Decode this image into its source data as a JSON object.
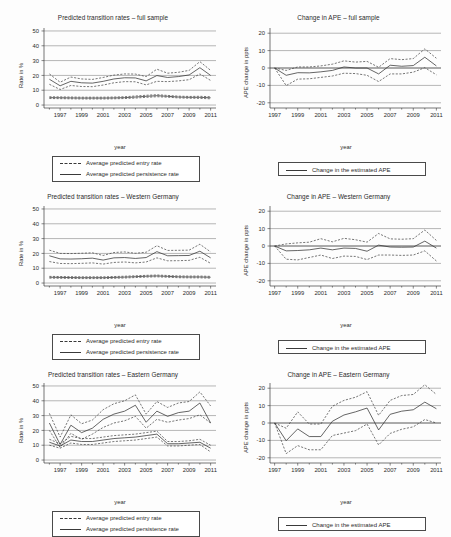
{
  "figure": {
    "caption_absent": true,
    "panel_count": 6,
    "xlabel": "year",
    "ylabel_rate": "Rate in %",
    "ylabel_ape": "APE change in ppts"
  },
  "legends": {
    "rates": {
      "entry": "Average predicted entry rate",
      "persistence": "Average predicted persistence rate"
    },
    "ape": {
      "estimate": "Change in the estimated APE"
    }
  },
  "chart_data": [
    {
      "id": "rates-full-sample",
      "type": "line",
      "title": "Predicted transition rates – full sample",
      "xlabel": "year",
      "ylabel": "Rate in %",
      "xlim": [
        1995.5,
        2011.5
      ],
      "ylim": [
        -2,
        52
      ],
      "yticks": [
        0,
        10,
        20,
        30,
        40,
        50
      ],
      "xticks": [
        1997,
        1999,
        2001,
        2003,
        2005,
        2007,
        2009,
        2011
      ],
      "xticks_minor_step": 1,
      "grid": "horizontal",
      "legend_position": "below",
      "x": [
        1996,
        1997,
        1998,
        1999,
        2000,
        2001,
        2002,
        2003,
        2004,
        2005,
        2006,
        2007,
        2008,
        2009,
        2010,
        2011
      ],
      "series": [
        {
          "name": "Average predicted persistence rate",
          "style": "solid",
          "values": [
            17.4,
            13.0,
            16.0,
            15.0,
            14.8,
            16.0,
            17.6,
            18.4,
            18.3,
            16.3,
            19.9,
            18.6,
            19.2,
            20.3,
            25.2,
            20.0
          ]
        },
        {
          "name": "Persistence rate upper CI",
          "style": "dashed",
          "values": [
            21.0,
            15.4,
            18.9,
            17.6,
            17.3,
            18.6,
            20.2,
            21.0,
            20.9,
            19.2,
            24.2,
            21.5,
            22.1,
            23.4,
            29.3,
            23.4
          ]
        },
        {
          "name": "Persistence rate lower CI",
          "style": "dashed",
          "values": [
            14.0,
            10.5,
            13.2,
            12.5,
            12.4,
            13.5,
            15.0,
            15.8,
            15.7,
            13.6,
            16.0,
            15.8,
            16.3,
            17.1,
            21.0,
            16.6
          ]
        },
        {
          "name": "Average predicted entry rate",
          "style": "solid",
          "values": [
            5.0,
            4.9,
            4.8,
            4.7,
            4.7,
            4.7,
            4.8,
            5.0,
            5.4,
            5.9,
            6.3,
            5.9,
            5.4,
            5.2,
            5.2,
            4.9
          ]
        },
        {
          "name": "Entry rate upper CI",
          "style": "dashed",
          "values": [
            5.6,
            5.5,
            5.4,
            5.3,
            5.3,
            5.3,
            5.4,
            5.6,
            6.1,
            6.6,
            7.0,
            6.5,
            6.0,
            5.8,
            5.9,
            5.6
          ]
        },
        {
          "name": "Entry rate lower CI",
          "style": "dashed",
          "values": [
            4.4,
            4.3,
            4.2,
            4.1,
            4.1,
            4.1,
            4.2,
            4.4,
            4.7,
            5.2,
            5.6,
            5.3,
            4.8,
            4.6,
            4.5,
            4.2
          ]
        }
      ]
    },
    {
      "id": "ape-full-sample",
      "type": "line",
      "title": "Change in APE – full sample",
      "xlabel": "year",
      "ylabel": "APE change in ppts",
      "xlim": [
        1996.6,
        2011.4
      ],
      "ylim": [
        -23,
        23
      ],
      "yticks": [
        -20,
        -10,
        0,
        10,
        20
      ],
      "xticks": [
        1997,
        1999,
        2001,
        2003,
        2005,
        2007,
        2009,
        2011
      ],
      "xticks_minor_step": 1,
      "grid": "horizontal",
      "legend_position": "below",
      "x": [
        1997,
        1998,
        1999,
        2000,
        2001,
        2002,
        2003,
        2004,
        2005,
        2006,
        2007,
        2008,
        2009,
        2010,
        2011
      ],
      "series": [
        {
          "name": "Change in the estimated APE",
          "style": "solid",
          "values": [
            0.0,
            -4.2,
            -2.7,
            -2.8,
            -2.2,
            -1.4,
            0.6,
            0.0,
            0.0,
            -3.4,
            1.6,
            1.0,
            1.4,
            6.2,
            1.2
          ]
        },
        {
          "name": "APE upper CI",
          "style": "dashed",
          "values": [
            0.0,
            -1.4,
            0.6,
            0.6,
            1.2,
            2.2,
            4.1,
            3.4,
            3.8,
            0.4,
            5.4,
            4.8,
            5.4,
            11.0,
            5.6
          ]
        },
        {
          "name": "APE lower CI",
          "style": "dashed",
          "values": [
            0.0,
            -10.1,
            -6.4,
            -6.2,
            -5.4,
            -4.6,
            -3.0,
            -3.2,
            -4.2,
            -7.8,
            -3.4,
            -3.4,
            -2.4,
            0.2,
            -3.9
          ]
        }
      ]
    },
    {
      "id": "rates-western-germany",
      "type": "line",
      "title": "Predicted transition rates – Western Germany",
      "xlabel": "year",
      "ylabel": "Rate in %",
      "xlim": [
        1995.5,
        2011.5
      ],
      "ylim": [
        -2,
        52
      ],
      "yticks": [
        0,
        10,
        20,
        30,
        40,
        50
      ],
      "xticks": [
        1997,
        1999,
        2001,
        2003,
        2005,
        2007,
        2009,
        2011
      ],
      "xticks_minor_step": 1,
      "grid": "horizontal",
      "legend_position": "below",
      "x": [
        1996,
        1997,
        1998,
        1999,
        2000,
        2001,
        2002,
        2003,
        2004,
        2005,
        2006,
        2007,
        2008,
        2009,
        2010,
        2011
      ],
      "series": [
        {
          "name": "Average predicted persistence rate",
          "style": "solid",
          "values": [
            18.4,
            16.3,
            16.2,
            16.4,
            16.8,
            15.5,
            17.0,
            17.2,
            16.6,
            17.2,
            21.2,
            18.4,
            18.5,
            18.6,
            21.5,
            17.0
          ]
        },
        {
          "name": "Persistence rate upper CI",
          "style": "dashed",
          "values": [
            22.2,
            20.0,
            19.9,
            20.1,
            20.4,
            18.6,
            20.6,
            21.0,
            20.1,
            20.8,
            25.2,
            22.0,
            22.1,
            22.2,
            26.2,
            21.0
          ]
        },
        {
          "name": "Persistence rate lower CI",
          "style": "dashed",
          "values": [
            14.5,
            13.2,
            13.1,
            13.3,
            13.6,
            12.8,
            13.9,
            14.2,
            13.6,
            14.2,
            17.0,
            15.0,
            15.1,
            15.3,
            17.4,
            13.3
          ]
        },
        {
          "name": "Average predicted entry rate",
          "style": "solid",
          "values": [
            3.9,
            3.8,
            3.7,
            3.6,
            3.6,
            3.6,
            3.8,
            4.0,
            4.3,
            4.6,
            4.8,
            4.5,
            4.2,
            4.1,
            4.1,
            3.9
          ]
        },
        {
          "name": "Entry rate upper CI",
          "style": "dashed",
          "values": [
            4.5,
            4.4,
            4.3,
            4.2,
            4.2,
            4.2,
            4.4,
            4.6,
            4.9,
            5.2,
            5.4,
            5.1,
            4.8,
            4.7,
            4.7,
            4.5
          ]
        },
        {
          "name": "Entry rate lower CI",
          "style": "dashed",
          "values": [
            3.3,
            3.2,
            3.1,
            3.0,
            3.0,
            3.0,
            3.2,
            3.4,
            3.7,
            4.0,
            4.2,
            3.9,
            3.6,
            3.5,
            3.5,
            3.3
          ]
        }
      ]
    },
    {
      "id": "ape-western-germany",
      "type": "line",
      "title": "Change in APE – Western Germany",
      "xlabel": "year",
      "ylabel": "APE change in ppts",
      "xlim": [
        1996.6,
        2011.4
      ],
      "ylim": [
        -23,
        23
      ],
      "yticks": [
        -20,
        -10,
        0,
        10,
        20
      ],
      "xticks": [
        1997,
        1999,
        2001,
        2003,
        2005,
        2007,
        2009,
        2011
      ],
      "xticks_minor_step": 1,
      "grid": "horizontal",
      "legend_position": "below",
      "x": [
        1997,
        1998,
        1999,
        2000,
        2001,
        2002,
        2003,
        2004,
        2005,
        2006,
        2007,
        2008,
        2009,
        2010,
        2011
      ],
      "series": [
        {
          "name": "Change in the estimated APE",
          "style": "solid",
          "values": [
            0.0,
            -2.8,
            -2.6,
            -2.2,
            -1.2,
            -2.2,
            -1.2,
            -1.4,
            -3.0,
            0.5,
            -0.6,
            -0.7,
            -0.6,
            2.8,
            -1.2
          ]
        },
        {
          "name": "APE upper CI",
          "style": "dashed",
          "values": [
            0.0,
            1.2,
            1.8,
            2.2,
            4.2,
            2.4,
            4.4,
            3.6,
            2.2,
            7.2,
            4.1,
            3.9,
            4.2,
            9.2,
            3.2
          ]
        },
        {
          "name": "APE lower CI",
          "style": "dashed",
          "values": [
            0.0,
            -7.6,
            -8.0,
            -6.6,
            -5.2,
            -7.2,
            -5.8,
            -6.0,
            -7.8,
            -5.2,
            -5.2,
            -5.4,
            -5.2,
            -2.8,
            -8.6
          ]
        }
      ]
    },
    {
      "id": "rates-eastern-germany",
      "type": "line",
      "title": "Predicted transition rates – Eastern Germany",
      "xlabel": "year",
      "ylabel": "Rate in %",
      "xlim": [
        1995.5,
        2011.5
      ],
      "ylim": [
        -2,
        52
      ],
      "yticks": [
        0,
        10,
        20,
        30,
        40,
        50
      ],
      "xticks": [
        1997,
        1999,
        2001,
        2003,
        2005,
        2007,
        2009,
        2011
      ],
      "xticks_minor_step": 1,
      "grid": "horizontal",
      "legend_position": "below",
      "x": [
        1996,
        1997,
        1998,
        1999,
        2000,
        2001,
        2002,
        2003,
        2004,
        2005,
        2006,
        2007,
        2008,
        2009,
        2010,
        2011
      ],
      "series": [
        {
          "name": "Average predicted persistence rate",
          "style": "solid",
          "values": [
            25.0,
            10.5,
            23.5,
            18.5,
            21.5,
            27.5,
            31.0,
            33.0,
            37.0,
            25.5,
            33.0,
            29.5,
            32.0,
            33.0,
            38.5,
            25.0
          ]
        },
        {
          "name": "Persistence rate upper CI",
          "style": "dashed",
          "values": [
            31.5,
            15.5,
            30.5,
            24.5,
            27.0,
            34.0,
            38.0,
            40.0,
            44.0,
            31.0,
            39.5,
            35.5,
            38.5,
            39.5,
            46.0,
            36.5
          ]
        },
        {
          "name": "Persistence rate lower CI",
          "style": "dashed",
          "values": [
            20.0,
            8.5,
            18.0,
            14.0,
            17.5,
            22.0,
            25.0,
            26.5,
            29.5,
            21.5,
            27.5,
            25.5,
            27.0,
            28.0,
            30.5,
            25.0
          ]
        },
        {
          "name": "Average predicted entry rate",
          "style": "solid",
          "values": [
            12.0,
            9.5,
            13.5,
            12.5,
            12.5,
            13.5,
            14.5,
            15.0,
            15.5,
            16.5,
            17.5,
            11.0,
            11.0,
            11.5,
            12.0,
            8.0
          ]
        },
        {
          "name": "Entry rate upper CI",
          "style": "dashed",
          "values": [
            14.0,
            11.0,
            16.0,
            14.5,
            14.5,
            15.5,
            16.5,
            17.0,
            17.5,
            18.5,
            19.5,
            12.5,
            12.5,
            13.0,
            14.0,
            10.0
          ]
        },
        {
          "name": "Entry rate lower CI",
          "style": "dashed",
          "values": [
            10.0,
            8.0,
            11.5,
            10.5,
            10.5,
            11.5,
            12.5,
            13.0,
            13.5,
            14.5,
            15.5,
            9.5,
            9.5,
            10.0,
            10.5,
            5.5
          ]
        }
      ]
    },
    {
      "id": "ape-eastern-germany",
      "type": "line",
      "title": "Change in APE – Eastern Germany",
      "xlabel": "year",
      "ylabel": "APE change in ppts",
      "xlim": [
        1996.6,
        2011.4
      ],
      "ylim": [
        -23,
        23
      ],
      "yticks": [
        -20,
        -10,
        0,
        10,
        20
      ],
      "xticks": [
        1997,
        1999,
        2001,
        2003,
        2005,
        2007,
        2009,
        2011
      ],
      "xticks_minor_step": 1,
      "grid": "horizontal",
      "legend_position": "below",
      "x": [
        1997,
        1998,
        1999,
        2000,
        2001,
        2002,
        2003,
        2004,
        2005,
        2006,
        2007,
        2008,
        2009,
        2010,
        2011
      ],
      "series": [
        {
          "name": "Change in the estimated APE",
          "style": "solid",
          "values": [
            0.0,
            -10.2,
            -3.4,
            -7.8,
            -7.8,
            1.0,
            4.6,
            6.4,
            8.6,
            -4.0,
            5.0,
            6.8,
            7.6,
            12.0,
            8.2
          ]
        },
        {
          "name": "APE upper CI",
          "style": "dashed",
          "values": [
            0.0,
            -3.0,
            6.4,
            -0.6,
            -0.6,
            9.6,
            13.0,
            14.8,
            18.0,
            4.4,
            13.0,
            15.8,
            16.4,
            22.0,
            16.4
          ]
        },
        {
          "name": "APE lower CI",
          "style": "dashed",
          "values": [
            0.0,
            -17.6,
            -13.0,
            -15.4,
            -15.4,
            -7.2,
            -5.8,
            -4.4,
            -0.6,
            -12.6,
            -6.0,
            -3.6,
            -2.2,
            2.0,
            0.0
          ]
        }
      ]
    }
  ]
}
